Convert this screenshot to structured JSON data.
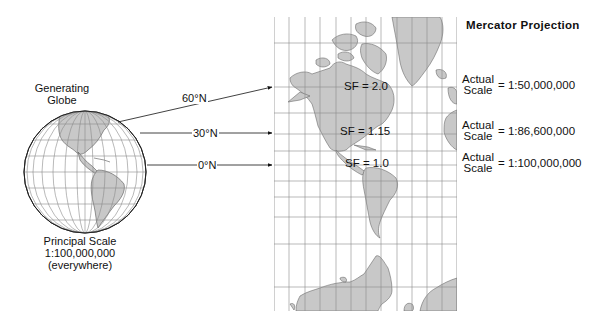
{
  "title": "Mercator Projection",
  "globe": {
    "label_line1": "Generating",
    "label_line2": "Globe",
    "principal_line1": "Principal Scale",
    "principal_line2": "1:100,000,000",
    "principal_line3": "(everywhere)"
  },
  "latitudes": [
    {
      "label": "60°N"
    },
    {
      "label": "30°N"
    },
    {
      "label": "0°N"
    }
  ],
  "scale_factors": [
    {
      "label": "SF = 2.0"
    },
    {
      "label": "SF = 1.15"
    },
    {
      "label": "SF = 1.0"
    }
  ],
  "actual_scales": [
    {
      "word1": "Actual",
      "word2": "Scale",
      "value": "= 1:50,000,000"
    },
    {
      "word1": "Actual",
      "word2": "Scale",
      "value": "= 1:86,600,000"
    },
    {
      "word1": "Actual",
      "word2": "Scale",
      "value": "= 1:100,000,000"
    }
  ],
  "colors": {
    "land": "#c8c8c8",
    "land_stroke": "#555555",
    "grid": "#8a8a8a",
    "text": "#111111"
  }
}
